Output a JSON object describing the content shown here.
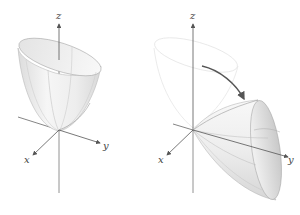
{
  "figure": {
    "colors": {
      "axis": "#555555",
      "surface_light": "#f2f2f2",
      "surface_shade": "#d9d9d9",
      "ghost_outline": "#e6e6e6",
      "rotation_arrow": "#555555"
    }
  },
  "left_panel": {
    "axis_labels": {
      "z": "z",
      "y": "y",
      "x": "x"
    },
    "surface": "paraboloid opening along +z"
  },
  "right_panel": {
    "axis_labels": {
      "z": "z",
      "y": "y",
      "x": "x"
    },
    "surface": "paraboloid opening along +y",
    "annotation": "rotation-arrow"
  }
}
